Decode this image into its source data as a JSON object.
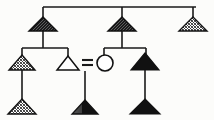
{
  "diagram": {
    "type": "pedigree-chart",
    "background_color": "#fcfcfa",
    "line_color": "#1a1a1a",
    "fill_solid_color": "#111111",
    "fill_open_color": "#ffffff",
    "hatch_color": "#3a3a3a",
    "generations": 3,
    "legend_note": "",
    "symbols": {
      "triangle_meaning": "male",
      "circle_meaning": "female",
      "equals_meaning": "mating / union",
      "solid_fill_meaning": "affected",
      "hatched_fill_meaning": "partially affected",
      "open_fill_meaning": "unaffected"
    },
    "mating_symbol_label": "=",
    "nodes": [
      {
        "id": "g1-1",
        "label": "",
        "shape": "triangle",
        "fill": "dark-hatched",
        "generation": 1,
        "x": 43,
        "y": 25
      },
      {
        "id": "g1-2",
        "label": "",
        "shape": "triangle",
        "fill": "dark-hatched",
        "generation": 1,
        "x": 122,
        "y": 25
      },
      {
        "id": "g1-3",
        "label": "",
        "shape": "triangle",
        "fill": "cross-hatched",
        "generation": 1,
        "x": 193,
        "y": 25
      },
      {
        "id": "g2-1",
        "label": "",
        "shape": "triangle",
        "fill": "cross-hatched",
        "generation": 2,
        "x": 22,
        "y": 62
      },
      {
        "id": "g2-2",
        "label": "",
        "shape": "triangle",
        "fill": "open",
        "generation": 2,
        "x": 68,
        "y": 62
      },
      {
        "id": "g2-3",
        "label": "",
        "shape": "circle",
        "fill": "open",
        "generation": 2,
        "x": 105,
        "y": 62
      },
      {
        "id": "g2-4",
        "label": "",
        "shape": "triangle",
        "fill": "solid",
        "generation": 2,
        "x": 145,
        "y": 62
      },
      {
        "id": "g3-1",
        "label": "",
        "shape": "triangle",
        "fill": "cross-hatched",
        "generation": 3,
        "x": 22,
        "y": 107
      },
      {
        "id": "g3-2",
        "label": "",
        "shape": "triangle",
        "fill": "dark-hatched",
        "generation": 3,
        "x": 85,
        "y": 107
      },
      {
        "id": "g3-3",
        "label": "",
        "shape": "triangle",
        "fill": "solid",
        "generation": 3,
        "x": 145,
        "y": 107
      }
    ],
    "edges": [
      {
        "id": "e-top-sibship",
        "from": "g1-1",
        "to": "g1-3",
        "kind": "sibship-bar"
      },
      {
        "id": "e-g1-1-children",
        "from": "g1-1",
        "to": "g2-1",
        "kind": "descent"
      },
      {
        "id": "e-g1-1-children-2",
        "from": "g1-1",
        "to": "g2-2",
        "kind": "descent"
      },
      {
        "id": "e-g1-2-children",
        "from": "g1-2",
        "to": "g2-3",
        "kind": "descent"
      },
      {
        "id": "e-g1-2-children-2",
        "from": "g1-2",
        "to": "g2-4",
        "kind": "descent"
      },
      {
        "id": "e-union",
        "from": "g2-2",
        "to": "g2-3",
        "kind": "mating"
      },
      {
        "id": "e-g2-1-child",
        "from": "g2-1",
        "to": "g3-1",
        "kind": "descent"
      },
      {
        "id": "e-union-child",
        "from": "e-union",
        "to": "g3-2",
        "kind": "descent"
      },
      {
        "id": "e-g2-4-child",
        "from": "g2-4",
        "to": "g3-3",
        "kind": "descent"
      }
    ]
  }
}
